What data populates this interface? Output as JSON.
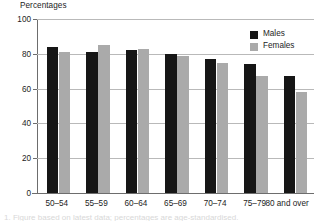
{
  "chart_data": {
    "type": "bar",
    "title": "",
    "ylabel": "Percentages",
    "xlabel": "",
    "ylim": [
      0,
      100
    ],
    "yticks": [
      0,
      20,
      40,
      60,
      80,
      100
    ],
    "ytick_labels": [
      "0",
      "20",
      "40",
      "60",
      "80",
      "100"
    ],
    "grid": true,
    "grid_axis": "y",
    "legend_position": "top-right",
    "categories": [
      "50–54",
      "55–59",
      "60–64",
      "65–69",
      "70–74",
      "75–79",
      "80 and over"
    ],
    "series": [
      {
        "name": "Males",
        "color": "#161616",
        "values": [
          84,
          81,
          82,
          80,
          77,
          74,
          67
        ]
      },
      {
        "name": "Females",
        "color": "#aaaaaa",
        "values": [
          81,
          85,
          83,
          79,
          75,
          67,
          58
        ]
      }
    ]
  },
  "axes": {
    "y_title": "Percentages",
    "tick_color": "#6d6d6d",
    "grid_color": "#b9b9b9"
  },
  "legend": {
    "entries": [
      {
        "label": "Males",
        "color": "#161616"
      },
      {
        "label": "Females",
        "color": "#aaaaaa"
      }
    ]
  },
  "caption": {
    "partial_text": "1. Figure based on latest data; percentages are age-standardised."
  }
}
